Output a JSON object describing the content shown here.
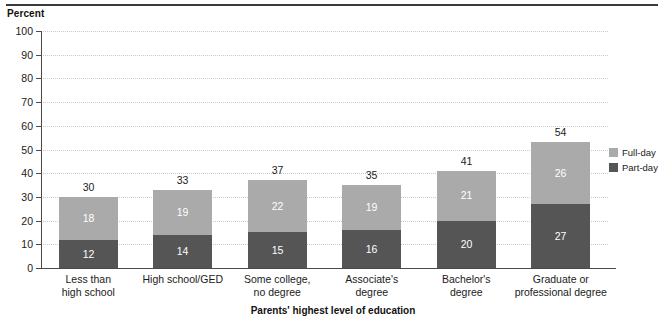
{
  "figure": {
    "y_unit_label": "Percent",
    "x_axis_title": "Parents' highest level of education"
  },
  "legend": {
    "items": [
      {
        "label": "Full-day",
        "color": "#aaaaaa",
        "swatch_name": "legend-swatch-full-day"
      },
      {
        "label": "Part-day",
        "color": "#555555",
        "swatch_name": "legend-swatch-part-day"
      }
    ]
  },
  "chart_data": {
    "type": "bar",
    "subtype": "stacked-bar",
    "title": "",
    "xlabel": "Parents' highest level of education",
    "ylabel": "Percent",
    "ylim": [
      0,
      100
    ],
    "ytick_labels": [
      "0",
      "10",
      "20",
      "30",
      "40",
      "50",
      "60",
      "70",
      "80",
      "90",
      "100"
    ],
    "ytick_values": [
      0,
      10,
      20,
      30,
      40,
      50,
      60,
      70,
      80,
      90,
      100
    ],
    "grid": true,
    "grid_style": "dotted-horizontal",
    "legend_position": "right",
    "categories": [
      "Less than high school",
      "High school/GED",
      "Some college, no degree",
      "Associate's degree",
      "Bachelor's degree",
      "Graduate or professional degree"
    ],
    "category_label_lines": [
      [
        "Less than",
        "high school"
      ],
      [
        "High school/GED"
      ],
      [
        "Some college,",
        "no degree"
      ],
      [
        "Associate's",
        "degree"
      ],
      [
        "Bachelor's",
        "degree"
      ],
      [
        "Graduate or",
        "professional degree"
      ]
    ],
    "series": [
      {
        "name": "Part-day",
        "color": "#555555",
        "values": [
          12,
          14,
          15,
          16,
          20,
          27
        ]
      },
      {
        "name": "Full-day",
        "color": "#aaaaaa",
        "values": [
          18,
          19,
          22,
          19,
          21,
          26
        ]
      }
    ],
    "totals": [
      30,
      33,
      37,
      35,
      41,
      54
    ],
    "total_labels": [
      "30",
      "33",
      "37",
      "35",
      "41",
      "54"
    ]
  }
}
